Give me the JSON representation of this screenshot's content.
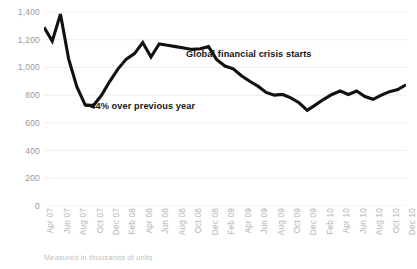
{
  "chart_data": {
    "type": "line",
    "title": "",
    "xlabel": "",
    "ylabel": "",
    "footnote": "Measured in thousands of units",
    "ylim": [
      0,
      1400
    ],
    "yticks": [
      0,
      200,
      400,
      600,
      800,
      1000,
      1200,
      1400
    ],
    "ytick_labels": [
      "0",
      "200",
      "400",
      "600",
      "800",
      "1,000",
      "1,200",
      "1,400"
    ],
    "grid": true,
    "grid_axis": "y",
    "legend": "none",
    "line_color": "#111111",
    "grid_color": "#ededed",
    "ytick_label_color": "#9a9a9a",
    "xtick_label_color": "#b4b4b4",
    "xtick_labels": [
      "Apr 07",
      "Jun 07",
      "Aug 07",
      "Oct 07",
      "Dec 07",
      "Feb 08",
      "Apr 08",
      "Jun 08",
      "Aug 08",
      "Oct 08",
      "Dec 08",
      "Feb 09",
      "Apr 09",
      "Jun 09",
      "Aug 09",
      "Oct 09",
      "Dec 09",
      "Feb 10",
      "Apr 10",
      "Jun 10",
      "Aug 10",
      "Oct 10",
      "Dec 10"
    ],
    "x": [
      "Apr 07",
      "May 07",
      "Jun 07",
      "Jul 07",
      "Aug 07",
      "Sep 07",
      "Oct 07",
      "Nov 07",
      "Dec 07",
      "Jan 08",
      "Feb 08",
      "Mar 08",
      "Apr 08",
      "May 08",
      "Jun 08",
      "Jul 08",
      "Aug 08",
      "Sep 08",
      "Oct 08",
      "Nov 08",
      "Dec 08",
      "Jan 09",
      "Feb 09",
      "Mar 09",
      "Apr 09",
      "May 09",
      "Jun 09",
      "Jul 09",
      "Aug 09",
      "Sep 09",
      "Oct 09",
      "Nov 09",
      "Dec 09",
      "Jan 10",
      "Feb 10",
      "Mar 10",
      "Apr 10",
      "May 10",
      "Jun 10",
      "Jul 10",
      "Aug 10",
      "Sep 10",
      "Oct 10",
      "Nov 10",
      "Dec 10"
    ],
    "values": [
      1290,
      1190,
      1385,
      1060,
      860,
      730,
      725,
      800,
      900,
      990,
      1060,
      1100,
      1180,
      1075,
      1170,
      1160,
      1150,
      1140,
      1130,
      1135,
      1150,
      1055,
      1010,
      990,
      940,
      900,
      865,
      820,
      800,
      805,
      780,
      745,
      690,
      730,
      770,
      805,
      830,
      805,
      830,
      790,
      770,
      800,
      825,
      840,
      875
    ],
    "annotations": [
      {
        "name": "crisis-start",
        "text": "Global financial crisis starts",
        "x": "Oct 08",
        "y": 1130
      },
      {
        "name": "decline-callout",
        "text": "–44% over previous year",
        "x": "Oct 07",
        "y": 725
      }
    ]
  }
}
